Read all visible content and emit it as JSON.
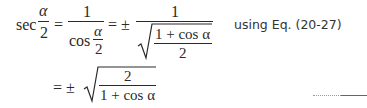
{
  "equation": {
    "line1": {
      "lhs_func": "sec",
      "lhs_num": "α",
      "lhs_den": "2",
      "eq1": "=",
      "frac1_num": "1",
      "frac1_den_func": "cos",
      "frac1_den_num": "α",
      "frac1_den_den": "2",
      "eq2": "= ±",
      "frac2_num": "1",
      "frac2_rad_num": "1 + cos α",
      "frac2_rad_den": "2"
    },
    "line2": {
      "eq": "= ±",
      "rad_num": "2",
      "rad_den": "1 + cos α"
    },
    "note": "using Eq. (20-27)"
  }
}
